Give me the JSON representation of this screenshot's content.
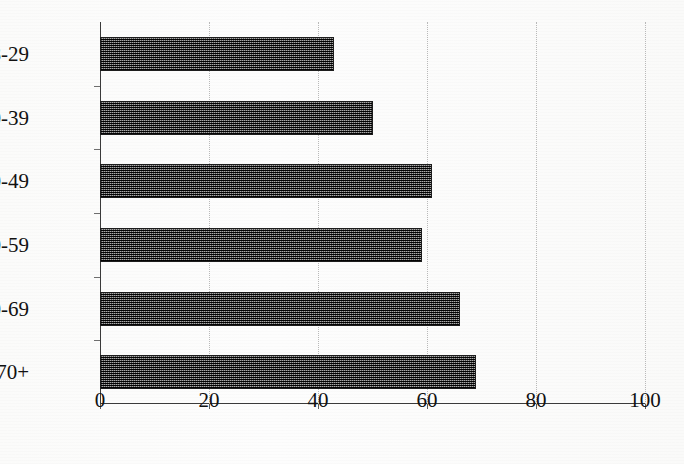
{
  "chart_data": {
    "type": "bar",
    "orientation": "horizontal",
    "title": "",
    "subtitle": "",
    "xlabel": "",
    "ylabel": "",
    "categories": [
      "18-29",
      "30-39",
      "40-49",
      "50-59",
      "60-69",
      "70+"
    ],
    "values": [
      43,
      50,
      61,
      59,
      66,
      69
    ],
    "series": [
      {
        "name": "",
        "values": [
          43,
          50,
          61,
          59,
          66,
          69
        ]
      }
    ],
    "xlim": [
      0,
      100
    ],
    "xticks": [
      0,
      20,
      40,
      60,
      80,
      100
    ],
    "xtick_labels": [
      "0",
      "20",
      "40",
      "60",
      "80",
      "100"
    ],
    "grid": "vertical-dotted",
    "legend": "none",
    "bar_fill": "#4a4a4a",
    "bar_border": "#1d1d1d",
    "axis_color": "#3a3a3a",
    "gridline_color": "#b9b9b9",
    "background": "#fdfdfc"
  }
}
